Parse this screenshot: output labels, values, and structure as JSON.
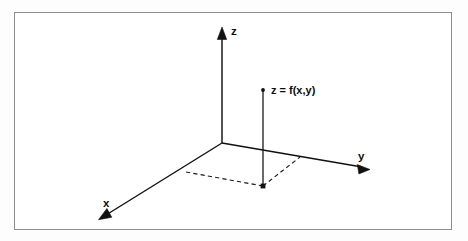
{
  "figure": {
    "kind": "3d-coordinate-axes-diagram",
    "background_color": "#ffffff",
    "outer_background_color": "#fdfdfd",
    "border_color": "#8d8d8f",
    "stroke_color": "#111111",
    "frame": {
      "x": 14,
      "y": 12,
      "width": 438,
      "height": 218
    }
  },
  "origin": {
    "x": 222,
    "y": 143
  },
  "axes": [
    {
      "id": "x",
      "label": "x",
      "from": {
        "x": 222,
        "y": 143
      },
      "to": {
        "x": 100,
        "y": 219
      },
      "label_position": {
        "x": 103,
        "y": 207
      },
      "arrow_angle_deg": 148,
      "direction": "down-left"
    },
    {
      "id": "y",
      "label": "y",
      "from": {
        "x": 222,
        "y": 143
      },
      "to": {
        "x": 368,
        "y": 168
      },
      "label_position": {
        "x": 358,
        "y": 160
      },
      "arrow_angle_deg": 9.7,
      "direction": "down-right"
    },
    {
      "id": "z",
      "label": "z",
      "from": {
        "x": 222,
        "y": 143
      },
      "to": {
        "x": 222,
        "y": 28
      },
      "label_position": {
        "x": 231,
        "y": 35
      },
      "arrow_angle_deg": -90,
      "direction": "up"
    }
  ],
  "point": {
    "label": "z = f(x,y)",
    "marker": {
      "x": 263,
      "y": 90,
      "radius": 1.9
    },
    "label_position": {
      "x": 271,
      "y": 94
    },
    "drop_line": {
      "from": {
        "x": 263,
        "y": 90
      },
      "to": {
        "x": 263,
        "y": 186
      }
    },
    "foot": {
      "x": 263,
      "y": 186,
      "radius": 2.0
    }
  },
  "projection_rectangle": {
    "style": "dashed",
    "x_axis_corner": {
      "x": 186,
      "y": 172
    },
    "foot_corner": {
      "x": 263,
      "y": 186
    },
    "y_axis_corner": {
      "x": 300,
      "y": 157
    }
  }
}
